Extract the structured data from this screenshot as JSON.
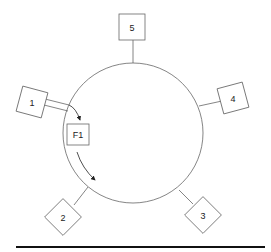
{
  "diagram": {
    "type": "ring-network",
    "ring": {
      "cx": 133,
      "cy": 133,
      "r": 70
    },
    "nodes": [
      {
        "id": "5",
        "label": "5"
      },
      {
        "id": "4",
        "label": "4"
      },
      {
        "id": "3",
        "label": "3"
      },
      {
        "id": "2",
        "label": "2"
      },
      {
        "id": "1",
        "label": "1"
      }
    ],
    "frame": {
      "label": "F1"
    },
    "colors": {
      "stroke": "#555555",
      "text": "#222222",
      "baseline": "#111111"
    }
  }
}
